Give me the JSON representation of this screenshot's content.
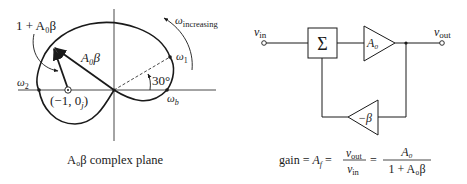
{
  "left_panel": {
    "caption": "A₀β complex plane",
    "labels": {
      "one_plus": "1 + A₀β",
      "a0beta": "A₀β",
      "omega_increasing_sym": "ω",
      "omega_increasing_sub": "increasing",
      "omega1_sym": "ω",
      "omega1_sub": "1",
      "omega2_sym": "ω",
      "omega2_sub": "2",
      "omegab_sym": "ω",
      "omegab_sub": "b",
      "angle": "30°",
      "point": "(−1, 0",
      "point_sub": "j",
      "point_close": ")"
    }
  },
  "right_panel": {
    "vin_sym": "v",
    "vin_sub": "in",
    "vout_sym": "v",
    "vout_sub": "out",
    "sum_symbol": "Σ",
    "forward_gain": "A₀",
    "feedback_gain": "−β",
    "formula": {
      "prefix": "gain = ",
      "af": "A",
      "af_sub": "f",
      "eq1": " = ",
      "num1": "vout",
      "den1": "vin",
      "eq2": " = ",
      "num2": "A₀",
      "den2": "1 + A₀β"
    }
  },
  "colors": {
    "ink": "#1a1a1a",
    "background": "#ffffff"
  }
}
